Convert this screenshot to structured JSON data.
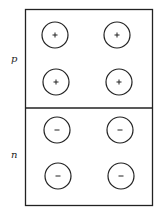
{
  "diagram": {
    "regions": [
      {
        "label": "p",
        "charge_sign": "+",
        "carriers": 4
      },
      {
        "label": "n",
        "charge_sign": "−",
        "carriers": 4
      }
    ]
  }
}
